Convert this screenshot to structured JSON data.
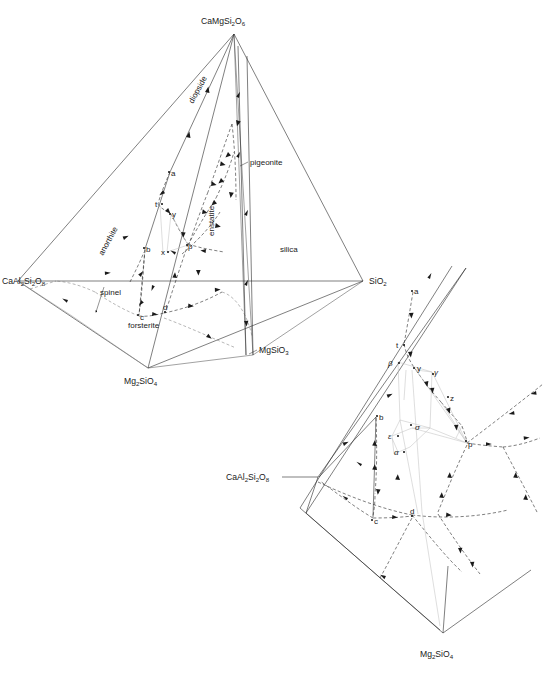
{
  "figure": {
    "background": "#ffffff",
    "line_color": "#2a2a2a",
    "width": 547,
    "height": 675
  },
  "main_diagram": {
    "name": "tetrahedron-main",
    "vertices": [
      {
        "id": "diopside-apex",
        "label_main": "CaMgSi",
        "label_sub1": "2",
        "label_mid": "O",
        "label_sub2": "6",
        "text": "CaMgSi2O6"
      },
      {
        "id": "anorthite-left",
        "label_main": "CaAl",
        "label_sub1": "2",
        "label_mid": "Si",
        "label_sub2": "2",
        "label_mid2": "O",
        "label_sub3": "8",
        "text": "CaAl2Si2O8"
      },
      {
        "id": "silica-right",
        "label_main": "SiO",
        "label_sub1": "2",
        "text": "SiO2"
      },
      {
        "id": "forsterite-bottom",
        "label_main": "Mg",
        "label_sub1": "2",
        "label_mid": "SiO",
        "label_sub2": "4",
        "text": "Mg2SiO4"
      },
      {
        "id": "enstatite-join",
        "label_main": "MgSiO",
        "label_sub1": "3",
        "text": "MgSiO3"
      }
    ],
    "phase_fields": [
      {
        "id": "diopside",
        "label": "diopside",
        "rotation": -62
      },
      {
        "id": "anorthite",
        "label": "anorthite",
        "rotation": -62
      },
      {
        "id": "enstatite",
        "label": "enstatite",
        "rotation": -90
      },
      {
        "id": "pigeonite",
        "label": "pigeonite",
        "rotation": 0
      },
      {
        "id": "silica",
        "label": "silica",
        "rotation": 0
      },
      {
        "id": "spinel",
        "label": "spinel",
        "rotation": 0
      },
      {
        "id": "forsterite",
        "label": "forsterite",
        "rotation": 0
      }
    ],
    "points": [
      {
        "id": "a",
        "label": "a",
        "x": 168,
        "y": 174
      },
      {
        "id": "b",
        "label": "b",
        "x": 143,
        "y": 250
      },
      {
        "id": "c",
        "label": "c",
        "x": 136,
        "y": 317
      },
      {
        "id": "d",
        "label": "d",
        "x": 164,
        "y": 312
      },
      {
        "id": "t",
        "label": "t",
        "x": 159,
        "y": 204
      },
      {
        "id": "y",
        "label": "y",
        "x": 172,
        "y": 213
      },
      {
        "id": "x",
        "label": "x",
        "x": 165,
        "y": 253
      },
      {
        "id": "p",
        "label": "p",
        "x": 189,
        "y": 245
      }
    ]
  },
  "detail_diagram": {
    "name": "tetrahedron-detail-enlargement",
    "vertices": [
      {
        "id": "anorthite-left-detail",
        "label_main": "CaAl",
        "label_sub1": "2",
        "label_mid": "Si",
        "label_sub2": "2",
        "label_mid2": "O",
        "label_sub3": "8",
        "text": "CaAl2Si2O8"
      },
      {
        "id": "forsterite-bottom-detail",
        "label_main": "Mg",
        "label_sub1": "2",
        "label_mid": "SiO",
        "label_sub2": "4",
        "text": "Mg2SiO4"
      }
    ],
    "points": [
      {
        "id": "a",
        "label": "a"
      },
      {
        "id": "b",
        "label": "b"
      },
      {
        "id": "c",
        "label": "c"
      },
      {
        "id": "d",
        "label": "d"
      },
      {
        "id": "t",
        "label": "t"
      },
      {
        "id": "y",
        "label": "y"
      },
      {
        "id": "p",
        "label": "p"
      },
      {
        "id": "z",
        "label": "z"
      },
      {
        "id": "alpha",
        "label": "α"
      },
      {
        "id": "beta",
        "label": "β"
      },
      {
        "id": "gamma",
        "label": "γ"
      },
      {
        "id": "sigma",
        "label": "σ"
      },
      {
        "id": "epsilon",
        "label": "ε"
      }
    ]
  }
}
